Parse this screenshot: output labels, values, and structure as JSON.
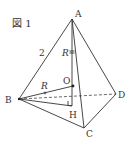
{
  "figure": {
    "caption": "図 1",
    "edge_label_AB": "2",
    "radius_label_AO": "R",
    "radius_label_BO": "R"
  },
  "vertices": {
    "A": {
      "label": "A",
      "x": 72,
      "y": 19
    },
    "B": {
      "label": "B",
      "x": 19,
      "y": 99
    },
    "C": {
      "label": "C",
      "x": 84,
      "y": 128
    },
    "D": {
      "label": "D",
      "x": 116,
      "y": 94
    },
    "O": {
      "label": "O",
      "x": 73,
      "y": 86
    },
    "H": {
      "label": "H",
      "x": 72,
      "y": 106
    }
  },
  "colors": {
    "line": "#333333",
    "background": "#ffffff"
  }
}
